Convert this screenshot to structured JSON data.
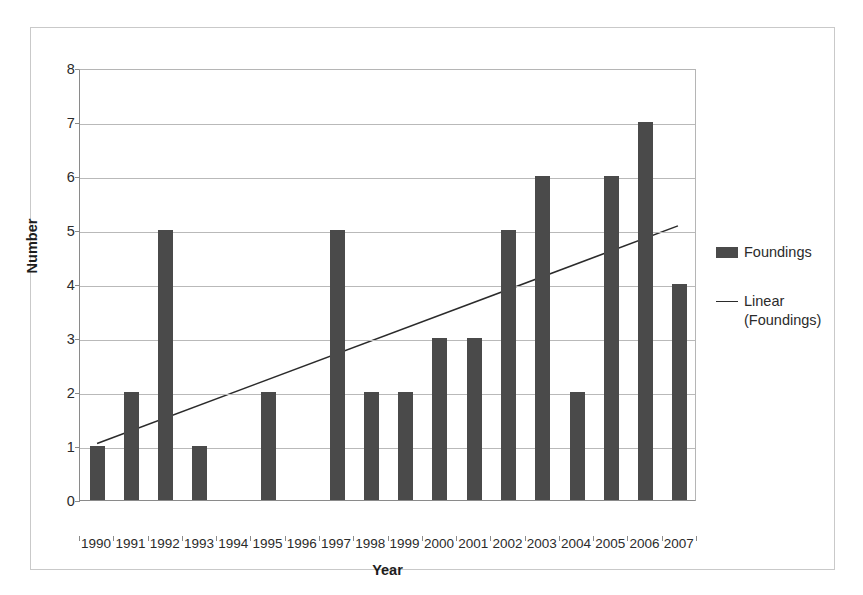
{
  "chart_data": {
    "type": "bar",
    "title": "",
    "xlabel": "Year",
    "ylabel": "Number",
    "categories": [
      "1990",
      "1991",
      "1992",
      "1993",
      "1994",
      "1995",
      "1996",
      "1997",
      "1998",
      "1999",
      "2000",
      "2001",
      "2002",
      "2003",
      "2004",
      "2005",
      "2006",
      "2007"
    ],
    "values": [
      1,
      2,
      5,
      1,
      0,
      2,
      0,
      5,
      2,
      2,
      3,
      3,
      5,
      6,
      2,
      6,
      7,
      4
    ],
    "series": [
      {
        "name": "Foundings",
        "values": [
          1,
          2,
          5,
          1,
          0,
          2,
          0,
          5,
          2,
          2,
          3,
          3,
          5,
          6,
          2,
          6,
          7,
          4
        ]
      }
    ],
    "trendline": {
      "name": "Linear (Foundings)",
      "start_value": 1.05,
      "end_value": 5.1
    },
    "ylim": [
      0,
      8
    ],
    "yticks": [
      0,
      1,
      2,
      3,
      4,
      5,
      6,
      7,
      8
    ],
    "ytick_labels": [
      "0",
      "1",
      "2",
      "3",
      "4",
      "5",
      "6",
      "7",
      "8"
    ],
    "grid": true,
    "legend_position": "right",
    "bar_color": "#4a4a4a",
    "trendline_color": "#2b2b2b",
    "gridline_color": "#b9b9b9",
    "axis_color": "#8a8a8a"
  },
  "legend": {
    "entries": [
      {
        "label": "Foundings",
        "marker": "bar-swatch"
      },
      {
        "label": "Linear",
        "label_line2": "(Foundings)",
        "marker": "line-swatch"
      }
    ]
  },
  "axes": {
    "y_title": "Number",
    "x_title": "Year"
  }
}
